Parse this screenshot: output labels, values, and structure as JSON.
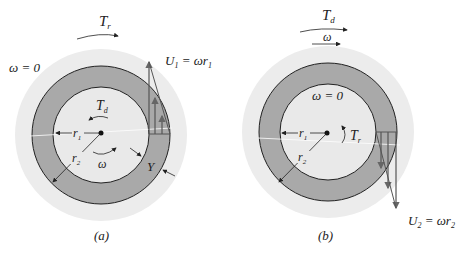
{
  "figure_a": {
    "caption": "(a)",
    "top_torque": "T",
    "top_torque_sub": "r",
    "omega_outer": "ω = 0",
    "inner_torque": "T",
    "inner_torque_sub": "d",
    "inner_omega": "ω",
    "r1": "r",
    "r1_sub": "1",
    "r2": "r",
    "r2_sub": "2",
    "gap": "Y",
    "velocity_label": "U",
    "velocity_label_sub": "1",
    "velocity_eq": " = ωr",
    "velocity_eq_sub": "1"
  },
  "figure_b": {
    "caption": "(b)",
    "top_torque": "T",
    "top_torque_sub": "d",
    "top_omega": "ω",
    "omega_inner": "ω = 0",
    "inner_torque": "T",
    "inner_torque_sub": "r",
    "r1": "r",
    "r1_sub": "1",
    "r2": "r",
    "r2_sub": "2",
    "velocity_label": "U",
    "velocity_label_sub": "2",
    "velocity_eq": " = ωr",
    "velocity_eq_sub": "2"
  },
  "colors": {
    "halo": "#ececec",
    "annulus": "#a9a9a9",
    "inner": "#e9e9e9",
    "arrow_profile": "#666666",
    "stroke": "#222222"
  }
}
